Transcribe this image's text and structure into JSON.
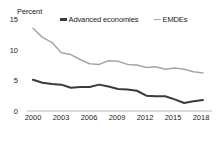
{
  "chart_data": {
    "type": "line",
    "title": "",
    "subtitle": "",
    "xlabel": "",
    "ylabel": "Percent",
    "ylim": [
      0,
      15
    ],
    "xlim": [
      2000,
      2018
    ],
    "yticks": [
      "0",
      "5",
      "10",
      "15"
    ],
    "ytick_values": [
      0,
      5,
      10,
      15
    ],
    "xticks": [
      "2000",
      "2003",
      "2006",
      "2009",
      "2012",
      "2015",
      "2018"
    ],
    "xtick_values": [
      2000,
      2003,
      2006,
      2009,
      2012,
      2015,
      2018
    ],
    "grid": false,
    "legend_position": "top",
    "x": [
      2000,
      2001,
      2002,
      2003,
      2004,
      2005,
      2006,
      2007,
      2008,
      2009,
      2010,
      2011,
      2012,
      2013,
      2014,
      2015,
      2016,
      2017,
      2018
    ],
    "series": [
      {
        "name": "Advanced economies",
        "color": "#3b3b3b",
        "values": [
          5.1,
          4.6,
          4.4,
          4.3,
          3.8,
          3.9,
          3.9,
          4.3,
          4.0,
          3.6,
          3.5,
          3.3,
          2.5,
          2.4,
          2.4,
          1.9,
          1.3,
          1.6,
          1.8
        ]
      },
      {
        "name": "EMDEs",
        "color": "#a6a6a6",
        "values": [
          13.5,
          12.0,
          11.2,
          9.5,
          9.2,
          8.4,
          7.7,
          7.6,
          8.2,
          8.1,
          7.6,
          7.5,
          7.1,
          7.2,
          6.8,
          7.0,
          6.8,
          6.4,
          6.2
        ]
      }
    ]
  },
  "axis": {
    "y_label": "Percent",
    "ytick_0": "0",
    "ytick_5": "5",
    "ytick_10": "10",
    "ytick_15": "15",
    "xtick_0": "2000",
    "xtick_1": "2003",
    "xtick_2": "2006",
    "xtick_3": "2009",
    "xtick_4": "2012",
    "xtick_5": "2015",
    "xtick_6": "2018"
  },
  "legend": {
    "series_1": "Advanced economies",
    "series_2": "EMDEs"
  }
}
